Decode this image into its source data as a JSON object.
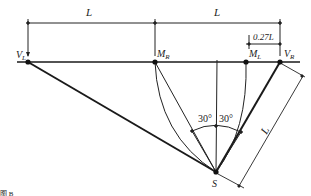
{
  "diagram": {
    "dimensions": {
      "left_span": "L",
      "right_span": "L",
      "offset": "0.27L",
      "slant": "L"
    },
    "points": {
      "v_left": "V",
      "v_left_sub": "L",
      "m_right": "M",
      "m_right_sub": "R",
      "m_left": "M",
      "m_left_sub": "L",
      "v_right": "V",
      "v_right_sub": "R",
      "s": "S"
    },
    "angles": {
      "left": "30°",
      "right": "30°"
    },
    "caption_fragment": "图 B"
  },
  "colors": {
    "line": "#1a1a1a",
    "thin": "#333333",
    "background": "#ffffff"
  }
}
